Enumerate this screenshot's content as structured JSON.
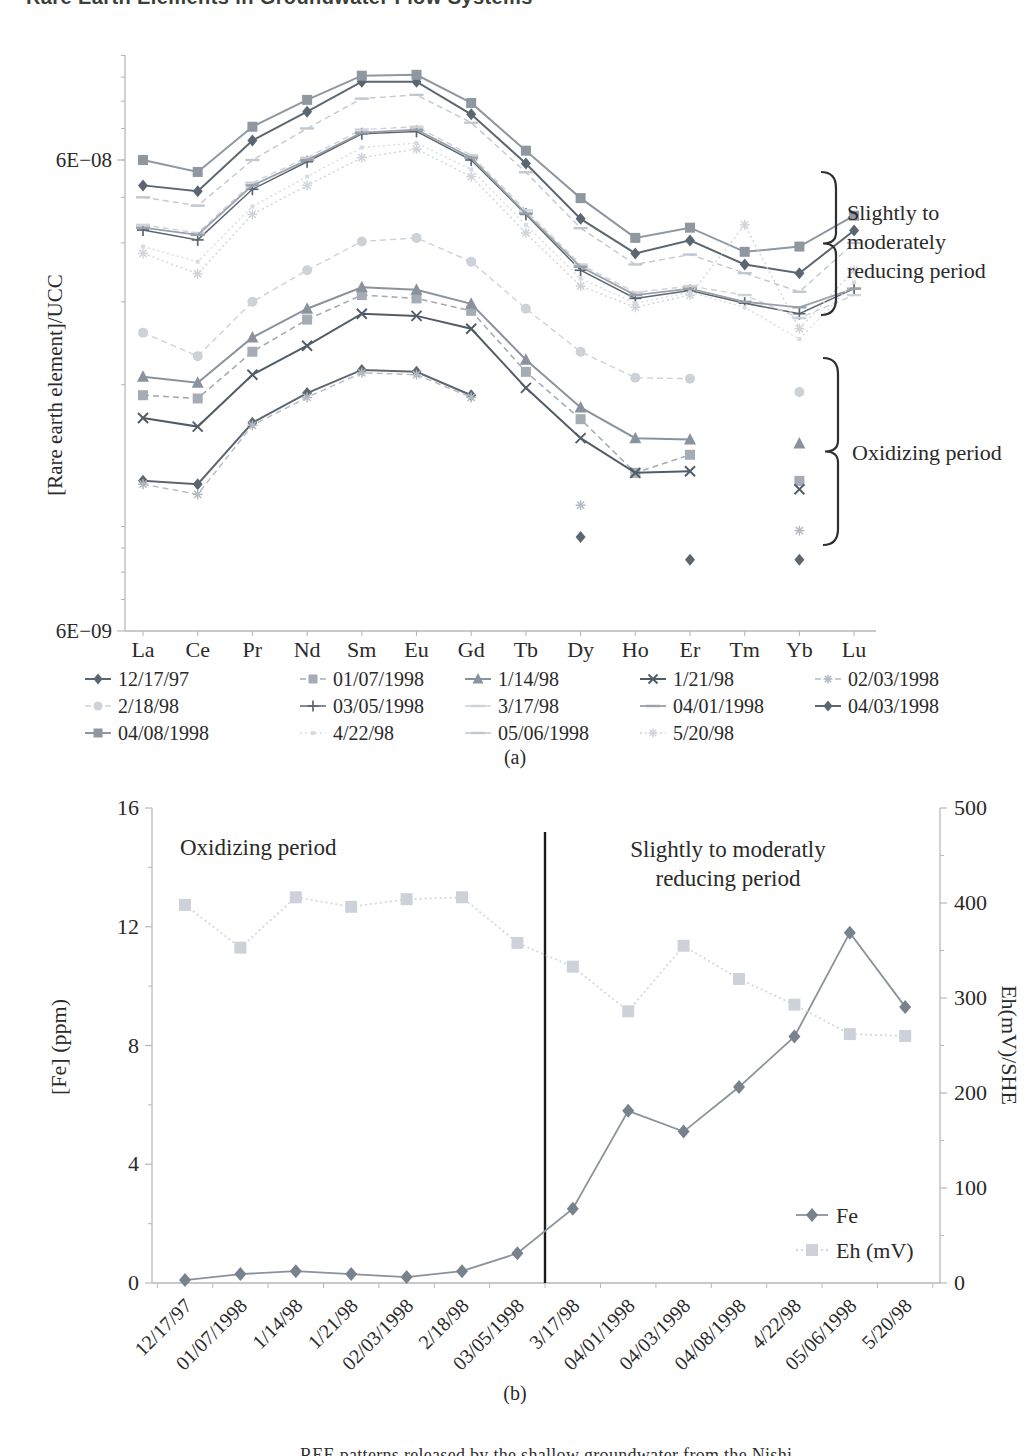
{
  "page": {
    "header_fragment": "Rare Earth Elements in Groundwater Flow Systems",
    "footer_fragment": "REE patterns released by the shallow groundwater from the Nishi",
    "caption_a": "(a)",
    "caption_b": "(b)"
  },
  "chart_data": [
    {
      "id": "a",
      "type": "line",
      "caption": "(a)",
      "ylabel": "[Rare earth element]/UCC",
      "y_scale": "log",
      "y_tick_labels": [
        {
          "label": "6E−08",
          "value_1e8": 6.0
        },
        {
          "label": "6E−09",
          "value_1e8": 0.6
        }
      ],
      "categories": [
        "La",
        "Ce",
        "Pr",
        "Nd",
        "Sm",
        "Eu",
        "Gd",
        "Tb",
        "Dy",
        "Ho",
        "Er",
        "Tm",
        "Yb",
        "Lu"
      ],
      "annotations": [
        {
          "text_lines": [
            "Slightly to",
            "moderately",
            "reducing period"
          ]
        },
        {
          "text_lines": [
            "Oxidizing period"
          ]
        }
      ],
      "value_scale": "1e-8",
      "series": [
        {
          "name": "12/17/97",
          "marker": "diamond",
          "color": "#5c6670",
          "line": "solid",
          "width": 2.0,
          "values": [
            1.25,
            1.23,
            1.66,
            1.92,
            2.15,
            2.13,
            1.9,
            null,
            0.95,
            null,
            0.85,
            null,
            0.85,
            null
          ]
        },
        {
          "name": "01/07/1998",
          "marker": "square",
          "color": "#a6acb5",
          "line": "dashed",
          "width": 1.6,
          "values": [
            1.9,
            1.87,
            2.35,
            2.75,
            3.1,
            3.05,
            2.87,
            2.13,
            1.69,
            1.3,
            1.42,
            null,
            1.25,
            null
          ]
        },
        {
          "name": "1/14/98",
          "marker": "triangle",
          "color": "#8a939d",
          "line": "solid",
          "width": 2.0,
          "values": [
            2.08,
            2.02,
            2.52,
            2.9,
            3.22,
            3.18,
            2.97,
            2.26,
            1.79,
            1.54,
            1.53,
            null,
            1.5,
            null
          ]
        },
        {
          "name": "1/21/98",
          "marker": "x",
          "color": "#525c66",
          "line": "solid",
          "width": 2.0,
          "values": [
            1.7,
            1.63,
            2.1,
            2.42,
            2.83,
            2.8,
            2.63,
            1.97,
            1.54,
            1.3,
            1.31,
            null,
            1.2,
            null
          ]
        },
        {
          "name": "02/03/1998",
          "marker": "asterisk",
          "color": "#b4bac2",
          "line": "dashed",
          "width": 1.4,
          "values": [
            1.23,
            1.17,
            1.64,
            1.88,
            2.12,
            2.1,
            1.88,
            null,
            1.11,
            null,
            null,
            null,
            0.98,
            null
          ]
        },
        {
          "name": "2/18/98",
          "marker": "circle",
          "color": "#ccd2d8",
          "line": "dashed",
          "width": 1.4,
          "values": [
            2.58,
            2.3,
            3.0,
            3.5,
            4.03,
            4.1,
            3.65,
            2.9,
            2.35,
            2.07,
            2.06,
            null,
            1.93,
            null
          ]
        },
        {
          "name": "03/05/1998",
          "marker": "plus",
          "color": "#5c6670",
          "line": "solid",
          "width": 1.5,
          "values": [
            4.26,
            4.06,
            5.2,
            5.95,
            6.82,
            6.9,
            6.0,
            4.6,
            3.5,
            3.05,
            3.17,
            2.98,
            2.83,
            3.2
          ]
        },
        {
          "name": "3/17/98",
          "marker": "dash",
          "color": "#ccd2d8",
          "line": "dashed",
          "width": 1.4,
          "values": [
            4.37,
            4.2,
            5.37,
            6.07,
            6.96,
            7.06,
            6.14,
            4.69,
            3.6,
            3.14,
            3.24,
            3.1,
            2.77,
            3.1
          ]
        },
        {
          "name": "04/01/1998",
          "marker": "dash",
          "color": "#99a0aa",
          "line": "solid",
          "width": 1.8,
          "values": [
            4.31,
            4.16,
            5.3,
            6.0,
            6.86,
            6.96,
            6.07,
            4.62,
            3.56,
            3.1,
            3.2,
            3.0,
            2.92,
            3.2
          ]
        },
        {
          "name": "04/03/1998",
          "marker": "diamond",
          "color": "#5c6670",
          "line": "solid",
          "width": 2.0,
          "values": [
            5.3,
            5.15,
            6.6,
            7.6,
            8.8,
            8.8,
            7.5,
            5.9,
            4.5,
            3.8,
            4.05,
            3.6,
            3.45,
            4.25
          ]
        },
        {
          "name": "04/08/1998",
          "marker": "square",
          "color": "#8f97a1",
          "line": "solid",
          "width": 2.0,
          "values": [
            6.0,
            5.66,
            7.06,
            8.05,
            9.06,
            9.1,
            7.93,
            6.28,
            4.98,
            4.1,
            4.31,
            3.83,
            3.93,
            4.57
          ]
        },
        {
          "name": "4/22/98",
          "marker": "dot",
          "color": "#d8dce2",
          "line": "dotted",
          "width": 1.4,
          "values": [
            3.93,
            3.65,
            4.78,
            5.53,
            6.38,
            6.52,
            5.73,
            4.37,
            3.36,
            2.98,
            3.14,
            2.92,
            2.5,
            3.3
          ]
        },
        {
          "name": "05/06/1998",
          "marker": "dash",
          "color": "#c2c8d0",
          "line": "dashed",
          "width": 1.4,
          "values": [
            5.0,
            4.8,
            6.0,
            7.0,
            8.1,
            8.25,
            7.2,
            5.65,
            4.3,
            3.6,
            3.78,
            3.45,
            3.15,
            4.0
          ]
        },
        {
          "name": "5/20/98",
          "marker": "asterisk",
          "color": "#d0d4da",
          "line": "dotted",
          "width": 1.4,
          "values": [
            3.8,
            3.44,
            4.6,
            5.3,
            6.07,
            6.33,
            5.53,
            4.2,
            3.24,
            2.92,
            3.1,
            4.37,
            2.63,
            3.5
          ]
        }
      ]
    },
    {
      "id": "b",
      "type": "line",
      "caption": "(b)",
      "left_axis": {
        "label": "[Fe] (ppm)",
        "min": 0,
        "max": 16,
        "ticks": [
          0,
          4,
          8,
          12,
          16
        ]
      },
      "right_axis": {
        "label": "Eh(mV)/SHE",
        "min": 0,
        "max": 500,
        "ticks": [
          0,
          100,
          200,
          300,
          400,
          500
        ]
      },
      "categories": [
        "12/17/97",
        "01/07/1998",
        "1/14/98",
        "1/21/98",
        "02/03/1998",
        "2/18/98",
        "03/05/1998",
        "3/17/98",
        "04/01/1998",
        "04/03/1998",
        "04/08/1998",
        "4/22/98",
        "05/06/1998",
        "5/20/98"
      ],
      "annotations": [
        {
          "text_lines": [
            "Oxidizing period"
          ]
        },
        {
          "text_lines": [
            "Slightly to moderatly",
            "reducing period"
          ]
        }
      ],
      "divider_after_index": 6,
      "series": [
        {
          "name": "Fe",
          "axis": "left",
          "marker": "diamond",
          "color": "#78828c",
          "line_color": "#8b929b",
          "line": "solid",
          "values": [
            0.1,
            0.3,
            0.4,
            0.3,
            0.2,
            0.4,
            1.0,
            2.5,
            5.8,
            5.1,
            6.6,
            8.3,
            11.8,
            9.3
          ]
        },
        {
          "name": "Eh (mV)",
          "axis": "right",
          "marker": "square",
          "color": "#cdd2da",
          "line_color": "#d3d8de",
          "line": "dotted",
          "values": [
            398,
            353,
            406,
            396,
            404,
            406,
            358,
            333,
            286,
            355,
            320,
            293,
            262,
            260
          ]
        }
      ],
      "legend": [
        "Fe",
        "Eh (mV)"
      ]
    }
  ]
}
